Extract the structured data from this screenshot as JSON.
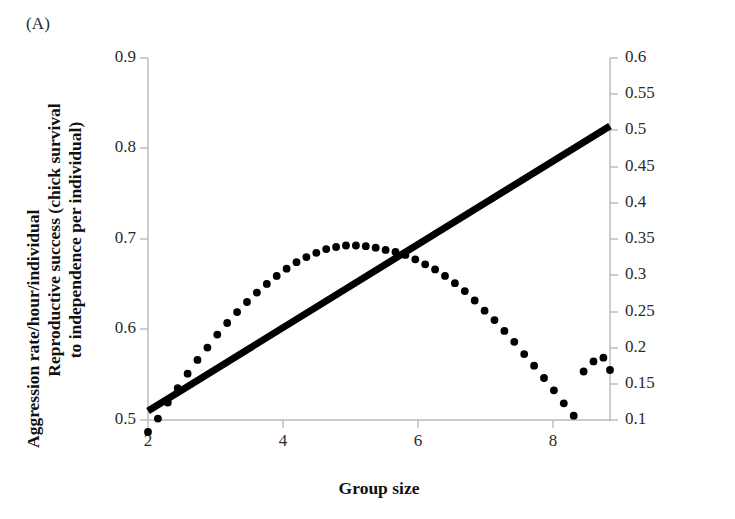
{
  "panel": {
    "label": "(A)"
  },
  "chart_data": {
    "type": "line",
    "title": "",
    "panel_label": "(A)",
    "xlabel": "Group size",
    "ylabel": "Reproductive success (chick survival to independence per individual)",
    "ylabel_line1": "Reproductive success (chick survival",
    "ylabel_line2": "to independence per individual)",
    "y2label": "Aggression rate/hour/individual",
    "xlim": [
      2,
      9
    ],
    "ylim": [
      0.5,
      0.9
    ],
    "y2lim": [
      0.1,
      0.6
    ],
    "xticks": [
      2,
      4,
      6,
      8
    ],
    "xtick_labels": [
      "2",
      "4",
      "6",
      "8"
    ],
    "yticks": [
      0.5,
      0.6,
      0.7,
      0.8,
      0.9
    ],
    "ytick_labels": [
      "0.5",
      "0.6",
      "0.7",
      "0.8",
      "0.9"
    ],
    "y2ticks": [
      0.1,
      0.15,
      0.2,
      0.25,
      0.3,
      0.35,
      0.4,
      0.45,
      0.5,
      0.55,
      0.6
    ],
    "y2tick_labels": [
      "0.1",
      "0.15",
      "0.2",
      "0.25",
      "0.3",
      "0.35",
      "0.4",
      "0.45",
      "0.5",
      "0.55",
      "0.6"
    ],
    "grid": false,
    "legend": "none",
    "series": [
      {
        "name": "Reproductive success",
        "axis": "left",
        "style": "solid-line",
        "color": "#000000",
        "x": [
          2,
          9
        ],
        "values": [
          0.51,
          0.825
        ]
      },
      {
        "name": "Aggression rate",
        "axis": "right",
        "style": "dotted-markers",
        "color": "#000000",
        "x": [
          2.0,
          2.15,
          2.3,
          2.45,
          2.6,
          2.75,
          2.9,
          3.05,
          3.2,
          3.35,
          3.5,
          3.65,
          3.8,
          3.95,
          4.1,
          4.25,
          4.4,
          4.55,
          4.7,
          4.85,
          5.0,
          5.15,
          5.3,
          5.45,
          5.6,
          5.75,
          5.9,
          6.05,
          6.2,
          6.35,
          6.5,
          6.65,
          6.8,
          6.95,
          7.1,
          7.25,
          7.4,
          7.55,
          7.7,
          7.85,
          8.0,
          8.15,
          8.3,
          8.45,
          8.6,
          8.75,
          8.9,
          9.0
        ],
        "values_left_axis": [
          0.487,
          0.502,
          0.519,
          0.535,
          0.551,
          0.566,
          0.58,
          0.594,
          0.607,
          0.619,
          0.63,
          0.641,
          0.65,
          0.659,
          0.667,
          0.674,
          0.68,
          0.685,
          0.689,
          0.6915,
          0.6925,
          0.6925,
          0.692,
          0.6905,
          0.688,
          0.6855,
          0.682,
          0.6775,
          0.672,
          0.666,
          0.659,
          0.651,
          0.642,
          0.632,
          0.621,
          0.61,
          0.598,
          0.586,
          0.573,
          0.56,
          0.5465,
          0.5325,
          0.5185,
          0.5045,
          0.5335,
          0.5445,
          0.5485,
          0.5355
        ],
        "values": [
          0.0835,
          0.102,
          0.124,
          0.144,
          0.164,
          0.183,
          0.2,
          0.218,
          0.234,
          0.249,
          0.263,
          0.276,
          0.288,
          0.299,
          0.309,
          0.318,
          0.325,
          0.331,
          0.336,
          0.339,
          0.341,
          0.341,
          0.34,
          0.338,
          0.335,
          0.332,
          0.328,
          0.322,
          0.315,
          0.308,
          0.299,
          0.289,
          0.278,
          0.265,
          0.251,
          0.238,
          0.223,
          0.208,
          0.191,
          0.175,
          0.158,
          0.141,
          0.123,
          0.106,
          0.167,
          0.181,
          0.186,
          0.169
        ]
      }
    ]
  }
}
